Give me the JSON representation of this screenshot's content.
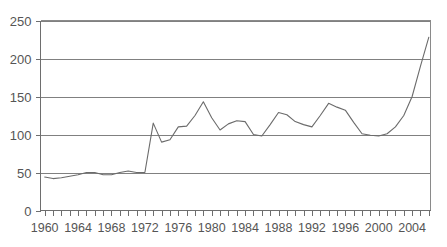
{
  "chart_data": {
    "type": "line",
    "title": "",
    "subtitle": "",
    "xlabel": "",
    "ylabel": "",
    "xlim": [
      1959.5,
      2006.2
    ],
    "ylim": [
      0,
      250
    ],
    "grid": true,
    "legend": null,
    "legend_position": "none",
    "y_ticks": [
      0,
      50,
      100,
      150,
      200,
      250
    ],
    "y_tick_labels": [
      "0",
      "50",
      "100",
      "150",
      "200",
      "250"
    ],
    "x_tick_labels": [
      "1960",
      "1964",
      "1968",
      "1972",
      "1976",
      "1980",
      "1984",
      "1988",
      "1992",
      "1996",
      "2000",
      "2004"
    ],
    "x_tick_label_values": [
      1960,
      1964,
      1968,
      1972,
      1976,
      1980,
      1984,
      1988,
      1992,
      1996,
      2000,
      2004
    ],
    "x_minor_tick_step": 1,
    "series": [
      {
        "name": "series-1",
        "color": "#6b6b6b",
        "x": [
          1960,
          1961,
          1962,
          1963,
          1964,
          1965,
          1966,
          1967,
          1968,
          1969,
          1970,
          1971,
          1972,
          1973,
          1974,
          1975,
          1976,
          1977,
          1978,
          1979,
          1980,
          1981,
          1982,
          1983,
          1984,
          1985,
          1986,
          1987,
          1988,
          1989,
          1990,
          1991,
          1992,
          1993,
          1994,
          1995,
          1996,
          1997,
          1998,
          1999,
          2000,
          2001,
          2002,
          2003,
          2004,
          2005,
          2006
        ],
        "values": [
          44,
          42,
          43,
          45,
          47,
          50,
          50,
          47,
          47,
          50,
          52,
          50,
          50,
          115,
          90,
          93,
          110,
          111,
          125,
          143,
          122,
          106,
          114,
          118,
          117,
          100,
          98,
          113,
          129,
          126,
          117,
          113,
          110,
          125,
          141,
          136,
          132,
          116,
          101,
          99,
          98,
          101,
          110,
          125,
          150,
          190,
          228
        ]
      }
    ]
  },
  "axes": {
    "y_axis_name": "y-axis",
    "x_axis_name": "x-axis"
  }
}
